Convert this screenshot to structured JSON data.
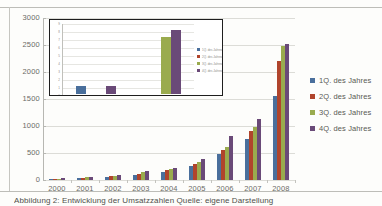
{
  "document": {
    "caption_partial": "Abbildung 2: Entwicklung der Umsatzzahlen  Quelle: eigene Darstellung"
  },
  "chart_data": [
    {
      "id": "main",
      "type": "bar",
      "title": "",
      "xlabel": "",
      "ylabel": "",
      "ylim": [
        0,
        3000
      ],
      "yticks": [
        "0",
        "500",
        "1000",
        "1500",
        "2000",
        "2500",
        "3000"
      ],
      "grid": true,
      "legend_position": "right",
      "categories": [
        "2000",
        "2001",
        "2002",
        "2003",
        "2004",
        "2005",
        "2006",
        "2007",
        "2008"
      ],
      "series": [
        {
          "name": "1Q. des Jahres",
          "color": "#4a6f9c",
          "values": [
            20,
            35,
            55,
            95,
            150,
            260,
            480,
            760,
            1560
          ]
        },
        {
          "name": "2Q. des Jahres",
          "color": "#b0442c",
          "values": [
            25,
            45,
            70,
            120,
            185,
            300,
            560,
            900,
            2210
          ]
        },
        {
          "name": "3Q. des Jahres",
          "color": "#9aab4e",
          "values": [
            28,
            50,
            80,
            140,
            200,
            330,
            620,
            980,
            2480
          ]
        },
        {
          "name": "4Q. des Jahres",
          "color": "#6a4a78",
          "values": [
            32,
            58,
            90,
            160,
            215,
            390,
            820,
            1130,
            2520
          ]
        }
      ]
    },
    {
      "id": "inset",
      "type": "bar",
      "title": "",
      "xlabel": "",
      "ylabel": "",
      "ylim": [
        0,
        9
      ],
      "yticks": [
        "9",
        "8",
        "7",
        "6",
        "5",
        "4",
        "3",
        "2",
        "1",
        "0"
      ],
      "grid": true,
      "legend_position": "right",
      "categories": [
        "1997",
        "1998"
      ],
      "series": [
        {
          "name": "1Q. des Jahres",
          "color": "#4a6f9c",
          "values": [
            1.0,
            0
          ]
        },
        {
          "name": "2Q. des Jahres",
          "color": "#b0442c",
          "values": [
            0,
            0
          ]
        },
        {
          "name": "3Q. des Jahres",
          "color": "#9aab4e",
          "values": [
            0,
            7.1
          ]
        },
        {
          "name": "4Q. des Jahres",
          "color": "#6a4a78",
          "values": [
            1.0,
            8.0
          ]
        }
      ]
    }
  ]
}
